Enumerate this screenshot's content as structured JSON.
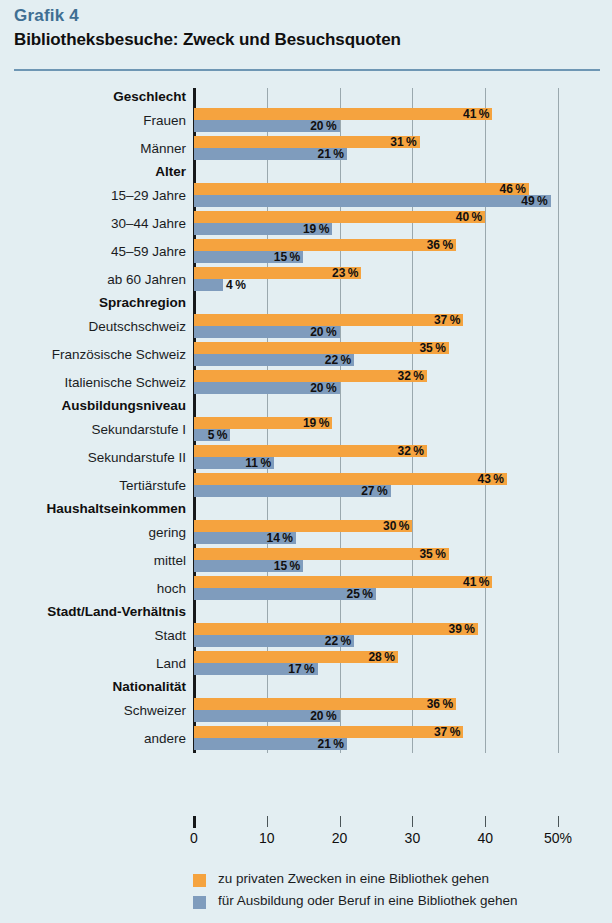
{
  "kicker": "Grafik 4",
  "title": "Bibliotheksbesuche: Zweck und Besuchsquoten",
  "colors": {
    "background": "#e3eef2",
    "kicker": "#3f6f93",
    "rule": "#6e96b4",
    "private_purpose": "#f5a33f",
    "training_purpose": "#7f9cbd",
    "gridline": "#9aa8ae",
    "axis": "#16181a"
  },
  "legend": {
    "position": "bottom",
    "items": [
      {
        "swatch": "private_purpose",
        "label": "zu privaten Zwecken in eine Bibliothek gehen"
      },
      {
        "swatch": "training_purpose",
        "label": "für Ausbildung oder Beruf in eine Bibliothek gehen"
      }
    ]
  },
  "axis": {
    "ticks": [
      0,
      10,
      20,
      30,
      40,
      50
    ],
    "ticklabels": [
      "0",
      "10",
      "20",
      "30",
      "40",
      "50%"
    ],
    "unit": "%"
  },
  "chart_data": {
    "type": "bar",
    "orientation": "horizontal",
    "title": "Bibliotheksbesuche: Zweck und Besuchsquoten",
    "subtitle": "Grafik 4",
    "xlabel": "",
    "ylabel": "",
    "xlim": [
      0,
      50
    ],
    "xticks": [
      0,
      10,
      20,
      30,
      40,
      50
    ],
    "grid": true,
    "value_suffix": "%",
    "series": [
      {
        "name": "zu privaten Zwecken in eine Bibliothek gehen",
        "key": "private",
        "color": "#f5a33f"
      },
      {
        "name": "für Ausbildung oder Beruf in eine Bibliothek gehen",
        "key": "training",
        "color": "#7f9cbd"
      }
    ],
    "groups": [
      {
        "header": "Geschlecht",
        "rows": [
          {
            "label": "Frauen",
            "private": 41,
            "training": 20
          },
          {
            "label": "Männer",
            "private": 31,
            "training": 21
          }
        ]
      },
      {
        "header": "Alter",
        "rows": [
          {
            "label": "15–29 Jahre",
            "private": 46,
            "training": 49
          },
          {
            "label": "30–44 Jahre",
            "private": 40,
            "training": 19
          },
          {
            "label": "45–59 Jahre",
            "private": 36,
            "training": 15
          },
          {
            "label": "ab 60 Jahren",
            "private": 23,
            "training": 4
          }
        ]
      },
      {
        "header": "Sprachregion",
        "rows": [
          {
            "label": "Deutschschweiz",
            "private": 37,
            "training": 20
          },
          {
            "label": "Französische Schweiz",
            "private": 35,
            "training": 22
          },
          {
            "label": "Italienische Schweiz",
            "private": 32,
            "training": 20
          }
        ]
      },
      {
        "header": "Ausbildungsniveau",
        "rows": [
          {
            "label": "Sekundarstufe I",
            "private": 19,
            "training": 5
          },
          {
            "label": "Sekundarstufe II",
            "private": 32,
            "training": 11
          },
          {
            "label": "Tertiärstufe",
            "private": 43,
            "training": 27
          }
        ]
      },
      {
        "header": "Haushaltseinkommen",
        "rows": [
          {
            "label": "gering",
            "private": 30,
            "training": 14
          },
          {
            "label": "mittel",
            "private": 35,
            "training": 15
          },
          {
            "label": "hoch",
            "private": 41,
            "training": 25
          }
        ]
      },
      {
        "header": "Stadt/Land-Verhältnis",
        "rows": [
          {
            "label": "Stadt",
            "private": 39,
            "training": 22
          },
          {
            "label": "Land",
            "private": 28,
            "training": 17
          }
        ]
      },
      {
        "header": "Nationalität",
        "rows": [
          {
            "label": "Schweizer",
            "private": 36,
            "training": 20
          },
          {
            "label": "andere",
            "private": 37,
            "training": 21
          }
        ]
      }
    ]
  }
}
